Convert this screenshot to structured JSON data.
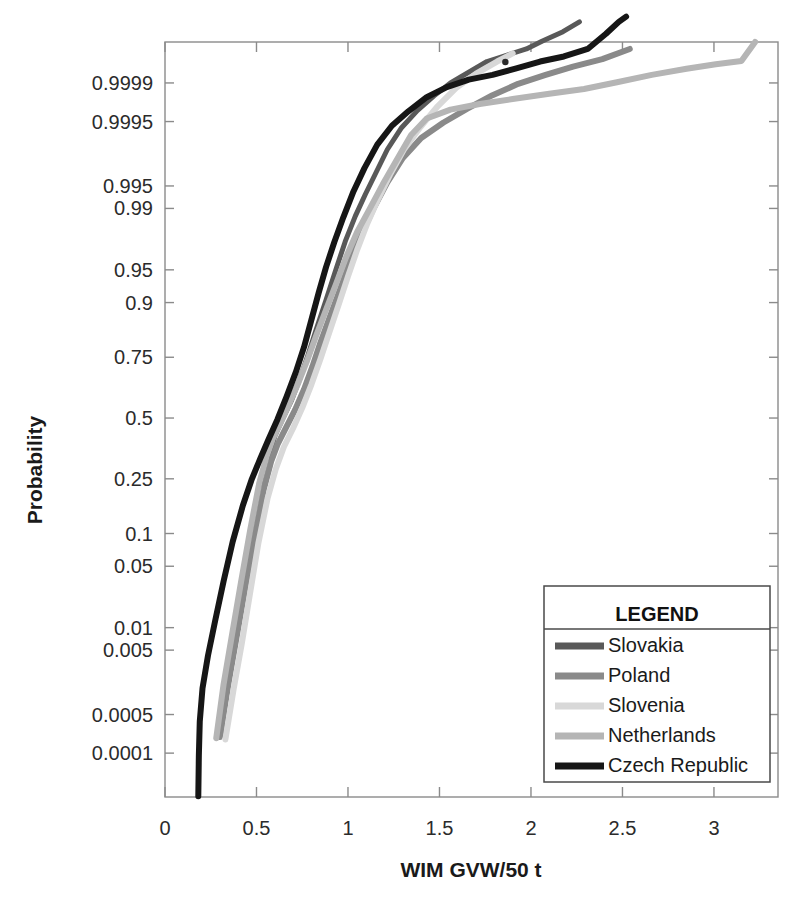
{
  "chart_data": {
    "type": "line",
    "title": "",
    "xlabel": "WIM GVW/50 t",
    "ylabel": "Probability",
    "plot_kind": "normal-probability-plot",
    "xlim": [
      0,
      3.35
    ],
    "xticks": [
      0,
      0.5,
      1,
      1.5,
      2,
      2.5,
      3
    ],
    "xtick_labels": [
      "0",
      "0.5",
      "1",
      "1.5",
      "2",
      "2.5",
      "3"
    ],
    "yticks": [
      0.0001,
      0.0005,
      0.005,
      0.01,
      0.05,
      0.1,
      0.25,
      0.5,
      0.75,
      0.9,
      0.95,
      0.99,
      0.995,
      0.9995,
      0.9999
    ],
    "ytick_labels": [
      "0.0001",
      "0.0005",
      "0.005",
      "0.01",
      "0.05",
      "0.1",
      "0.25",
      "0.5",
      "0.75",
      "0.9",
      "0.95",
      "0.99",
      "0.995",
      "0.9995",
      "0.9999"
    ],
    "ylim_probability": [
      1.3e-05,
      0.999985
    ],
    "grid": false,
    "legend_position": "bottom-right",
    "legend_title": "LEGEND",
    "series": [
      {
        "name": "Slovakia",
        "color": "#595959",
        "width": 5,
        "points": [
          [
            0.305,
            0.00022
          ],
          [
            0.345,
            0.0016
          ],
          [
            0.385,
            0.0075
          ],
          [
            0.425,
            0.028
          ],
          [
            0.47,
            0.085
          ],
          [
            0.52,
            0.2
          ],
          [
            0.565,
            0.33
          ],
          [
            0.6,
            0.42
          ],
          [
            0.645,
            0.5
          ],
          [
            0.69,
            0.575
          ],
          [
            0.735,
            0.665
          ],
          [
            0.78,
            0.755
          ],
          [
            0.825,
            0.835
          ],
          [
            0.88,
            0.905
          ],
          [
            0.935,
            0.951
          ],
          [
            0.985,
            0.975
          ],
          [
            1.04,
            0.9875
          ],
          [
            1.095,
            0.9935
          ],
          [
            1.15,
            0.99665
          ],
          [
            1.215,
            0.99856
          ],
          [
            1.29,
            0.99935
          ],
          [
            1.38,
            0.99968
          ],
          [
            1.47,
            0.999825
          ],
          [
            1.56,
            0.9999
          ],
          [
            1.66,
            0.999938
          ],
          [
            1.76,
            0.999962
          ],
          [
            1.87,
            0.999972
          ],
          [
            1.975,
            0.999979
          ],
          [
            2.06,
            0.9999855
          ],
          [
            2.175,
            0.999991
          ],
          [
            2.265,
            0.9999945
          ]
        ]
      },
      {
        "name": "Poland",
        "color": "#8a8a8a",
        "width": 6,
        "points": [
          [
            0.3,
            0.0002
          ],
          [
            0.345,
            0.0015
          ],
          [
            0.39,
            0.0072
          ],
          [
            0.44,
            0.031
          ],
          [
            0.49,
            0.095
          ],
          [
            0.54,
            0.215
          ],
          [
            0.58,
            0.315
          ],
          [
            0.615,
            0.385
          ],
          [
            0.66,
            0.455
          ],
          [
            0.71,
            0.535
          ],
          [
            0.76,
            0.625
          ],
          [
            0.805,
            0.715
          ],
          [
            0.85,
            0.8
          ],
          [
            0.9,
            0.868
          ],
          [
            0.955,
            0.922
          ],
          [
            1.01,
            0.958
          ],
          [
            1.07,
            0.9785
          ],
          [
            1.14,
            0.99
          ],
          [
            1.215,
            0.99555
          ],
          [
            1.3,
            0.99805
          ],
          [
            1.4,
            0.99906
          ],
          [
            1.52,
            0.999476
          ],
          [
            1.65,
            0.9997
          ],
          [
            1.79,
            0.99983
          ],
          [
            1.93,
            0.999896
          ],
          [
            2.08,
            0.99993
          ],
          [
            2.23,
            0.999952
          ],
          [
            2.39,
            0.999966
          ],
          [
            2.54,
            0.999979
          ]
        ]
      },
      {
        "name": "Slovenia",
        "color": "#d8d8d8",
        "width": 6,
        "points": [
          [
            0.33,
            0.00018
          ],
          [
            0.375,
            0.0013
          ],
          [
            0.42,
            0.0062
          ],
          [
            0.465,
            0.026
          ],
          [
            0.51,
            0.082
          ],
          [
            0.56,
            0.185
          ],
          [
            0.605,
            0.285
          ],
          [
            0.65,
            0.375
          ],
          [
            0.7,
            0.455
          ],
          [
            0.75,
            0.545
          ],
          [
            0.8,
            0.645
          ],
          [
            0.85,
            0.745
          ],
          [
            0.9,
            0.832
          ],
          [
            0.95,
            0.897
          ],
          [
            1.0,
            0.942
          ],
          [
            1.05,
            0.969
          ],
          [
            1.105,
            0.9845
          ],
          [
            1.165,
            0.99245
          ],
          [
            1.23,
            0.99655
          ],
          [
            1.305,
            0.99855
          ],
          [
            1.395,
            0.999375
          ],
          [
            1.49,
            0.99973
          ],
          [
            1.59,
            0.999875
          ],
          [
            1.7,
            0.999934
          ],
          [
            1.815,
            0.999962
          ],
          [
            1.9,
            0.999974
          ]
        ]
      },
      {
        "name": "Netherlands",
        "color": "#b5b5b5",
        "width": 6,
        "points": [
          [
            0.28,
            0.00019
          ],
          [
            0.32,
            0.00155
          ],
          [
            0.365,
            0.0078
          ],
          [
            0.415,
            0.034
          ],
          [
            0.465,
            0.106
          ],
          [
            0.515,
            0.235
          ],
          [
            0.555,
            0.335
          ],
          [
            0.59,
            0.41
          ],
          [
            0.63,
            0.475
          ],
          [
            0.675,
            0.555
          ],
          [
            0.725,
            0.645
          ],
          [
            0.775,
            0.735
          ],
          [
            0.825,
            0.818
          ],
          [
            0.88,
            0.885
          ],
          [
            0.935,
            0.932
          ],
          [
            0.99,
            0.963
          ],
          [
            1.05,
            0.9805
          ],
          [
            1.12,
            0.99
          ],
          [
            1.19,
            0.99525
          ],
          [
            1.27,
            0.998
          ],
          [
            1.345,
            0.99916
          ],
          [
            1.43,
            0.999556
          ],
          [
            1.56,
            0.99969
          ],
          [
            1.72,
            0.999754
          ],
          [
            1.9,
            0.9998
          ],
          [
            2.1,
            0.99984
          ],
          [
            2.29,
            0.99987
          ],
          [
            2.47,
            0.999903
          ],
          [
            2.66,
            0.99993
          ],
          [
            2.85,
            0.999947
          ],
          [
            3.01,
            0.999957
          ],
          [
            3.15,
            0.999963
          ],
          [
            3.225,
            0.999985
          ]
        ]
      },
      {
        "name": "Czech Republic",
        "color": "#161616",
        "width": 6,
        "points": [
          [
            0.182,
            1.35e-05
          ],
          [
            0.185,
            9e-05
          ],
          [
            0.19,
            0.00038
          ],
          [
            0.205,
            0.00135
          ],
          [
            0.235,
            0.0042
          ],
          [
            0.275,
            0.0125
          ],
          [
            0.32,
            0.035
          ],
          [
            0.37,
            0.085
          ],
          [
            0.425,
            0.165
          ],
          [
            0.475,
            0.25
          ],
          [
            0.52,
            0.325
          ],
          [
            0.565,
            0.405
          ],
          [
            0.615,
            0.495
          ],
          [
            0.665,
            0.595
          ],
          [
            0.715,
            0.695
          ],
          [
            0.76,
            0.785
          ],
          [
            0.8,
            0.862
          ],
          [
            0.84,
            0.918
          ],
          [
            0.88,
            0.953
          ],
          [
            0.925,
            0.9745
          ],
          [
            0.975,
            0.98715
          ],
          [
            1.03,
            0.99405
          ],
          [
            1.09,
            0.99723
          ],
          [
            1.16,
            0.998795
          ],
          [
            1.24,
            0.99941
          ],
          [
            1.33,
            0.999668
          ],
          [
            1.43,
            0.999815
          ],
          [
            1.54,
            0.99988
          ],
          [
            1.66,
            0.9999135
          ],
          [
            1.79,
            0.99993
          ],
          [
            1.92,
            0.999948
          ],
          [
            2.05,
            0.999962
          ],
          [
            2.18,
            0.99997
          ],
          [
            2.31,
            0.999979
          ],
          [
            2.41,
            0.99999
          ],
          [
            2.48,
            0.9999945
          ],
          [
            2.52,
            0.9999958
          ]
        ]
      }
    ],
    "annotations": [
      {
        "name": "stray-dot",
        "x": 1.86,
        "y_px": 62
      }
    ]
  },
  "legend": {
    "title": "LEGEND",
    "entries": [
      {
        "label": "Slovakia",
        "color": "#595959"
      },
      {
        "label": "Poland",
        "color": "#8a8a8a"
      },
      {
        "label": "Slovenia",
        "color": "#d8d8d8"
      },
      {
        "label": "Netherlands",
        "color": "#b5b5b5"
      },
      {
        "label": "Czech Republic",
        "color": "#161616"
      }
    ]
  },
  "axes": {
    "x_title": "WIM GVW/50 t",
    "y_title": "Probability"
  }
}
